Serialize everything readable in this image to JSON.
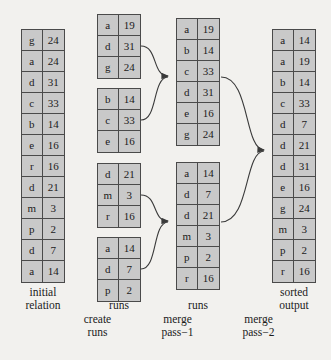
{
  "figure": {
    "cell_fill": "#c9c9c9",
    "border_color": "#4a4a4a",
    "background": "#f2f1ee"
  },
  "columns": [
    {
      "name": "initial-relation",
      "label": "initial\nrelation",
      "label_line1": "initial",
      "label_line2": "relation",
      "blocks": [
        {
          "name": "initial-relation-block",
          "rows": [
            {
              "key": "g",
              "value": "24"
            },
            {
              "key": "a",
              "value": "24"
            },
            {
              "key": "d",
              "value": "31"
            },
            {
              "key": "c",
              "value": "33"
            },
            {
              "key": "b",
              "value": "14"
            },
            {
              "key": "e",
              "value": "16"
            },
            {
              "key": "r",
              "value": "16"
            },
            {
              "key": "d",
              "value": "21"
            },
            {
              "key": "m",
              "value": "3"
            },
            {
              "key": "p",
              "value": "2"
            },
            {
              "key": "d",
              "value": "7"
            },
            {
              "key": "a",
              "value": "14"
            }
          ]
        }
      ]
    },
    {
      "name": "runs-after-create",
      "label": "runs",
      "blocks": [
        {
          "name": "run-1",
          "rows": [
            {
              "key": "a",
              "value": "19"
            },
            {
              "key": "d",
              "value": "31"
            },
            {
              "key": "g",
              "value": "24"
            }
          ]
        },
        {
          "name": "run-2",
          "rows": [
            {
              "key": "b",
              "value": "14"
            },
            {
              "key": "c",
              "value": "33"
            },
            {
              "key": "e",
              "value": "16"
            }
          ]
        },
        {
          "name": "run-3",
          "rows": [
            {
              "key": "d",
              "value": "21"
            },
            {
              "key": "m",
              "value": "3"
            },
            {
              "key": "r",
              "value": "16"
            }
          ]
        },
        {
          "name": "run-4",
          "rows": [
            {
              "key": "a",
              "value": "14"
            },
            {
              "key": "d",
              "value": "7"
            },
            {
              "key": "p",
              "value": "2"
            }
          ]
        }
      ]
    },
    {
      "name": "runs-after-merge-pass-1",
      "label": "runs",
      "blocks": [
        {
          "name": "merged-run-1",
          "rows": [
            {
              "key": "a",
              "value": "19"
            },
            {
              "key": "b",
              "value": "14"
            },
            {
              "key": "c",
              "value": "33"
            },
            {
              "key": "d",
              "value": "31"
            },
            {
              "key": "e",
              "value": "16"
            },
            {
              "key": "g",
              "value": "24"
            }
          ]
        },
        {
          "name": "merged-run-2",
          "rows": [
            {
              "key": "a",
              "value": "14"
            },
            {
              "key": "d",
              "value": "7"
            },
            {
              "key": "d",
              "value": "21"
            },
            {
              "key": "m",
              "value": "3"
            },
            {
              "key": "p",
              "value": "2"
            },
            {
              "key": "r",
              "value": "16"
            }
          ]
        }
      ]
    },
    {
      "name": "sorted-output",
      "label_line1": "sorted",
      "label_line2": "output",
      "blocks": [
        {
          "name": "sorted-output-block",
          "rows": [
            {
              "key": "a",
              "value": "14"
            },
            {
              "key": "a",
              "value": "19"
            },
            {
              "key": "b",
              "value": "14"
            },
            {
              "key": "c",
              "value": "33"
            },
            {
              "key": "d",
              "value": "7"
            },
            {
              "key": "d",
              "value": "21"
            },
            {
              "key": "d",
              "value": "31"
            },
            {
              "key": "e",
              "value": "16"
            },
            {
              "key": "g",
              "value": "24"
            },
            {
              "key": "m",
              "value": "3"
            },
            {
              "key": "p",
              "value": "2"
            },
            {
              "key": "r",
              "value": "16"
            }
          ]
        }
      ]
    }
  ],
  "stage_labels": {
    "create_runs_line1": "create",
    "create_runs_line2": "runs",
    "merge_pass_1_line1": "merge",
    "merge_pass_1_line2": "pass−1",
    "merge_pass_2_line1": "merge",
    "merge_pass_2_line2": "pass−2"
  },
  "column_labels": {
    "initial_line1": "initial",
    "initial_line2": "relation",
    "runs_1": "runs",
    "runs_2": "runs",
    "sorted_line1": "sorted",
    "sorted_line2": "output"
  }
}
